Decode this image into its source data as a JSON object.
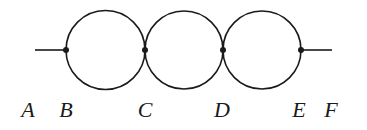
{
  "diagram": {
    "stroke_color": "#1a1a1a",
    "background": "#ffffff",
    "baseline_y": 50,
    "lead_left": {
      "x1": 35,
      "x2": 66
    },
    "lead_right": {
      "x1": 301,
      "x2": 332
    },
    "circles": [
      {
        "cx": 105.5,
        "cy": 50,
        "r": 39.5
      },
      {
        "cx": 184,
        "cy": 50,
        "r": 39
      },
      {
        "cx": 262,
        "cy": 50,
        "r": 39
      }
    ],
    "nodes": [
      {
        "id": "B",
        "x": 66,
        "y": 50
      },
      {
        "id": "C",
        "x": 145,
        "y": 50
      },
      {
        "id": "D",
        "x": 223,
        "y": 50
      },
      {
        "id": "E",
        "x": 301,
        "y": 50
      }
    ],
    "labels": [
      {
        "text": "A",
        "x": 28,
        "y": 117
      },
      {
        "text": "B",
        "x": 66,
        "y": 117
      },
      {
        "text": "C",
        "x": 145,
        "y": 117
      },
      {
        "text": "D",
        "x": 222,
        "y": 117
      },
      {
        "text": "E",
        "x": 299,
        "y": 117
      },
      {
        "text": "F",
        "x": 331,
        "y": 117
      }
    ]
  }
}
